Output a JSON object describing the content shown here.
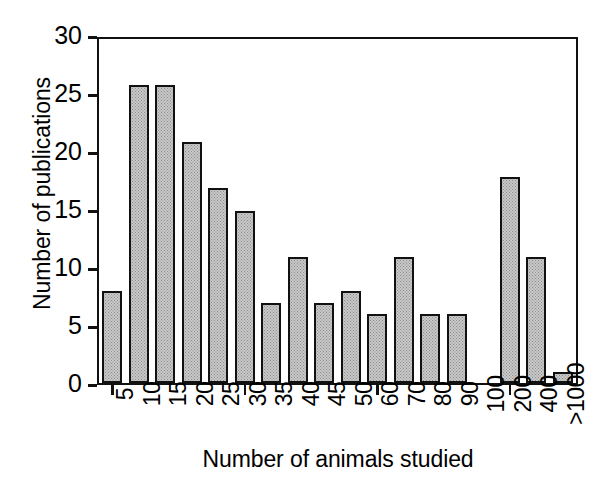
{
  "chart_data": {
    "type": "bar",
    "title": "",
    "xlabel": "Number of animals studied",
    "ylabel": "Number of publications",
    "categories": [
      "5",
      "10",
      "15",
      "20",
      "25",
      "30",
      "35",
      "40",
      "45",
      "50",
      "60",
      "70",
      "80",
      "90",
      "100",
      "200",
      "400",
      ">1000"
    ],
    "values": [
      8,
      26,
      26,
      21,
      17,
      15,
      7,
      11,
      7,
      8,
      6,
      11,
      6,
      6,
      0,
      18,
      11,
      1
    ],
    "ylim": [
      0,
      30
    ],
    "y_ticks": [
      0,
      5,
      10,
      15,
      20,
      25,
      30
    ],
    "y_tick_labels": [
      "0",
      "5",
      "10",
      "15",
      "20",
      "25",
      "30"
    ],
    "x_tick_indices": [
      0,
      5,
      10,
      15
    ],
    "grid": false,
    "legend": false,
    "legend_position": "none",
    "bar_fill_color": "#c8c8c8",
    "bar_edge_color": "#111111",
    "axis_color": "#111111",
    "background_color": "#ffffff"
  }
}
